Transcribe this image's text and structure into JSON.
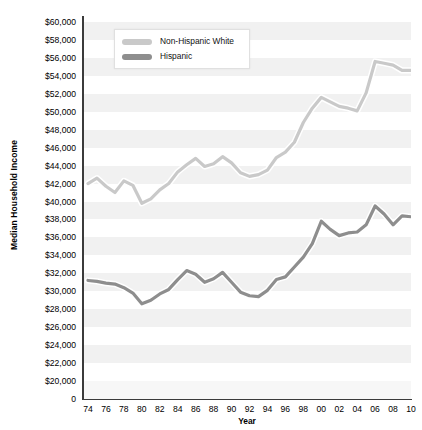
{
  "chart_data": {
    "type": "line",
    "title": "",
    "xlabel": "Year",
    "ylabel": "Median Household Income",
    "xlim": [
      1974,
      2010
    ],
    "ylim": [
      20000,
      60000
    ],
    "grid": "horizontal-bands",
    "legend_position": "top-left-inside",
    "x": [
      1974,
      1975,
      1976,
      1977,
      1978,
      1979,
      1980,
      1981,
      1982,
      1983,
      1984,
      1985,
      1986,
      1987,
      1988,
      1989,
      1990,
      1991,
      1992,
      1993,
      1994,
      1995,
      1996,
      1997,
      1998,
      1999,
      2000,
      2001,
      2002,
      2003,
      2004,
      2005,
      2006,
      2007,
      2008,
      2009,
      2010
    ],
    "x_tick_labels": [
      "74",
      "76",
      "78",
      "80",
      "82",
      "84",
      "86",
      "88",
      "90",
      "92",
      "94",
      "96",
      "98",
      "00",
      "02",
      "04",
      "06",
      "08",
      "10"
    ],
    "y_tick_labels": [
      "$60,000",
      "$58,000",
      "$56,000",
      "$54,000",
      "$52,000",
      "$50,000",
      "$48,000",
      "$46,000",
      "$44,000",
      "$42,000",
      "$40,000",
      "$38,000",
      "$36,000",
      "$34,000",
      "$32,000",
      "$30,000",
      "$28,000",
      "$26,000",
      "$24,000",
      "$22,000",
      "$20,000",
      "0"
    ],
    "y_tick_values": [
      60000,
      58000,
      56000,
      54000,
      52000,
      50000,
      48000,
      46000,
      44000,
      42000,
      40000,
      38000,
      36000,
      34000,
      32000,
      30000,
      28000,
      26000,
      24000,
      22000,
      20000,
      0
    ],
    "series": [
      {
        "name": "Non-Hispanic White",
        "color": "#c9c9c9",
        "values": [
          42000,
          42600,
          41700,
          41000,
          42300,
          41800,
          39800,
          40300,
          41300,
          42000,
          43300,
          44100,
          44800,
          43900,
          44200,
          45000,
          44300,
          43200,
          42800,
          43000,
          43500,
          44900,
          45500,
          46600,
          48800,
          50400,
          51600,
          51100,
          50600,
          50400,
          50100,
          52100,
          55600,
          55400,
          55200,
          54600,
          54600
        ]
      },
      {
        "name": "Hispanic",
        "color": "#8e8e8e",
        "values": [
          31200,
          31100,
          30900,
          30800,
          30400,
          29800,
          28600,
          29000,
          29700,
          30200,
          31300,
          32300,
          31900,
          31000,
          31400,
          32100,
          31000,
          29900,
          29500,
          29400,
          30100,
          31300,
          31600,
          32700,
          33800,
          35300,
          37800,
          36900,
          36200,
          36500,
          36600,
          37400,
          39500,
          38600,
          37400,
          38400,
          38300
        ]
      }
    ]
  },
  "legend": {
    "items": [
      {
        "label": "Non-Hispanic White",
        "color": "#c9c9c9"
      },
      {
        "label": "Hispanic",
        "color": "#8e8e8e"
      }
    ]
  },
  "axes": {
    "y_title": "Median Household Income",
    "x_title": "Year"
  },
  "colors": {
    "band": "#f1f1f1",
    "axis": "#3b3b3b",
    "text": "#000000",
    "plot_background": "#ffffff"
  }
}
